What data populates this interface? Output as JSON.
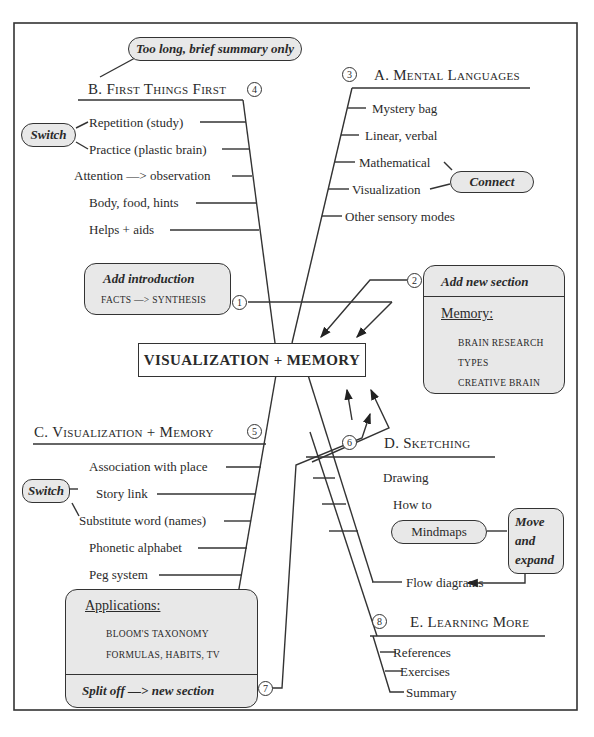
{
  "frame": {
    "border_color": "#333333",
    "note_fill": "#e8e8e8"
  },
  "center": {
    "title": "VISUALIZATION + MEMORY"
  },
  "notes": {
    "top_summary": "Too long, brief summary only",
    "switch_b": "Switch",
    "connect": "Connect",
    "add_intro_title": "Add introduction",
    "add_intro_body": "FACTS —> SYNTHESIS",
    "add_section_title": "Add new section",
    "add_section_heading": "Memory:",
    "add_section_items": [
      "BRAIN RESEARCH",
      "TYPES",
      "CREATIVE BRAIN"
    ],
    "switch_c": "Switch",
    "applications_heading": "Applications:",
    "applications_items": [
      "BLOOM'S TAXONOMY",
      "FORMULAS, HABITS, TV"
    ],
    "split_off": "Split off —> new section",
    "mindmaps": "Mindmaps",
    "move_expand": [
      "Move",
      "and",
      "expand"
    ]
  },
  "markers": [
    "1",
    "2",
    "3",
    "4",
    "5",
    "6",
    "7",
    "8"
  ],
  "sections": {
    "a": {
      "title": "A. Mental Languages",
      "items": [
        "Mystery bag",
        "Linear, verbal",
        "Mathematical",
        "Visualization",
        "Other sensory modes"
      ]
    },
    "b": {
      "title": "B. First Things First",
      "items": [
        "Repetition (study)",
        "Practice (plastic brain)",
        "Attention —> observation",
        "Body, food, hints",
        "Helps + aids"
      ]
    },
    "c": {
      "title": "C. Visualization + Memory",
      "items": [
        "Association with place",
        "Story link",
        "Substitute word (names)",
        "Phonetic alphabet",
        "Peg system"
      ]
    },
    "d": {
      "title": "D. Sketching",
      "items": [
        "Drawing",
        "How to",
        "Flow diagrams"
      ]
    },
    "e": {
      "title": "E. Learning More",
      "items": [
        "References",
        "Exercises",
        "Summary"
      ]
    }
  }
}
